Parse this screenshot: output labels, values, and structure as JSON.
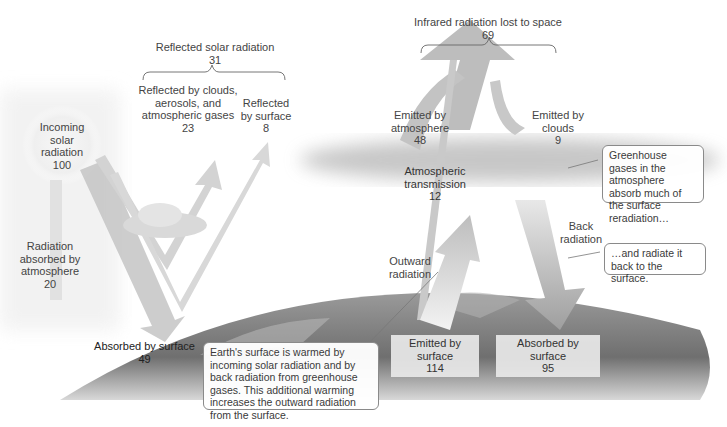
{
  "diagram": {
    "reflected": {
      "title": "Reflected solar radiation",
      "value": "31"
    },
    "reflected_clouds": {
      "line1": "Reflected by clouds,",
      "line2": "aerosols, and",
      "line3": "atmospheric gases",
      "value": "23"
    },
    "reflected_surface": {
      "line1": "Reflected",
      "line2": "by surface",
      "value": "8"
    },
    "incoming": {
      "line1": "Incoming",
      "line2": "solar",
      "line3": "radiation",
      "value": "100"
    },
    "absorbed_atmosphere": {
      "line1": "Radiation",
      "line2": "absorbed by",
      "line3": "atmosphere",
      "value": "20"
    },
    "absorbed_surface_solar": {
      "label": "Absorbed by surface",
      "value": "49"
    },
    "infrared_lost": {
      "title": "Infrared radiation lost to space",
      "value": "69"
    },
    "emitted_atmosphere": {
      "line1": "Emitted by",
      "line2": "atmosphere",
      "value": "48"
    },
    "emitted_clouds": {
      "line1": "Emitted by",
      "line2": "clouds",
      "value": "9"
    },
    "atmospheric_transmission": {
      "line1": "Atmospheric",
      "line2": "transmission",
      "value": "12"
    },
    "outward_radiation": {
      "line1": "Outward",
      "line2": "radiation"
    },
    "back_radiation": {
      "line1": "Back",
      "line2": "radiation"
    },
    "emitted_surface": {
      "label": "Emitted by surface",
      "value": "114"
    },
    "absorbed_surface_back": {
      "label": "Absorbed by surface",
      "value": "95"
    },
    "callouts": {
      "greenhouse": "Greenhouse gases in the atmosphere absorb much of the surface reradiation…",
      "radiate_back": "…and radiate it back to the surface.",
      "earth_warmed": "Earth's surface is warmed by incoming solar radiation and by back radiation from greenhouse gases. This additional warming increases the outward radiation from the surface."
    }
  }
}
